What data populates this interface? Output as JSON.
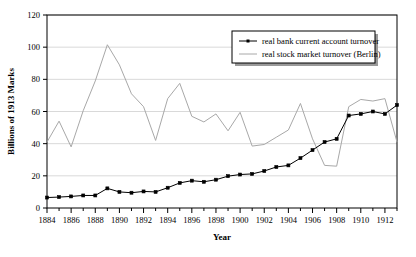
{
  "chart_data": {
    "type": "line",
    "title": "",
    "xlabel": "Year",
    "ylabel": "Billions of 1913 Marks",
    "xlim": [
      1884,
      1913
    ],
    "ylim": [
      0,
      120
    ],
    "yticks": [
      0,
      20,
      40,
      60,
      80,
      100,
      120
    ],
    "xticks": [
      1884,
      1886,
      1888,
      1890,
      1892,
      1894,
      1896,
      1898,
      1900,
      1902,
      1904,
      1906,
      1908,
      1910,
      1912
    ],
    "x": [
      1884,
      1885,
      1886,
      1887,
      1888,
      1889,
      1890,
      1891,
      1892,
      1893,
      1894,
      1895,
      1896,
      1897,
      1898,
      1899,
      1900,
      1901,
      1902,
      1903,
      1904,
      1905,
      1906,
      1907,
      1908,
      1909,
      1910,
      1911,
      1912,
      1913
    ],
    "grid": true,
    "legend_position": "top-right",
    "series": [
      {
        "name": "real bank current account turnover",
        "color": "#000000",
        "markers": true,
        "values": [
          6.5,
          6.8,
          7.2,
          7.8,
          7.8,
          12.2,
          10.0,
          9.5,
          10.3,
          10.0,
          12.6,
          15.6,
          17.0,
          16.3,
          17.6,
          19.8,
          20.8,
          21.2,
          23.0,
          25.5,
          26.5,
          31.0,
          36.0,
          41.0,
          43.0,
          57.5,
          58.5,
          60.0,
          58.5,
          64.0
        ]
      },
      {
        "name": "real stock market turnover (Berlin)",
        "color": "#a8a8a8",
        "markers": false,
        "values": [
          41.0,
          54.0,
          38.0,
          60.5,
          79.0,
          101.5,
          89.0,
          71.0,
          63.0,
          42.0,
          68.0,
          77.5,
          57.0,
          53.5,
          58.5,
          48.0,
          59.5,
          38.5,
          39.5,
          44.0,
          48.5,
          65.0,
          43.0,
          26.5,
          26.0,
          63.0,
          67.5,
          66.5,
          68.0,
          41.0
        ]
      }
    ]
  }
}
